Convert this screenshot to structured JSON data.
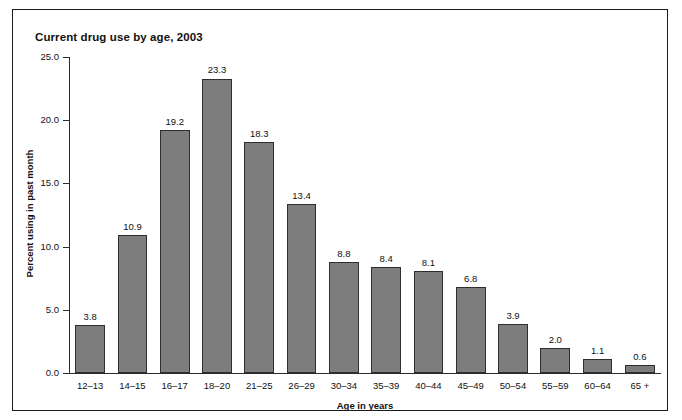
{
  "chart_data": {
    "type": "bar",
    "title": "Current drug use by age, 2003",
    "xlabel": "Age in years",
    "ylabel": "Percent using in past month",
    "categories": [
      "12–13",
      "14–15",
      "16–17",
      "18–20",
      "21–25",
      "26–29",
      "30–34",
      "35–39",
      "40–44",
      "45–49",
      "50–54",
      "55–59",
      "60–64",
      "65 +"
    ],
    "values": [
      3.8,
      10.9,
      19.2,
      23.3,
      18.3,
      13.4,
      8.8,
      8.4,
      8.1,
      6.8,
      3.9,
      2.0,
      1.1,
      0.6
    ],
    "value_labels": [
      "3.8",
      "10.9",
      "19.2",
      "23.3",
      "18.3",
      "13.4",
      "8.8",
      "8.4",
      "8.1",
      "6.8",
      "3.9",
      "2.0",
      "1.1",
      "0.6"
    ],
    "ylim": [
      0.0,
      25.0
    ],
    "ytick_values": [
      0.0,
      5.0,
      10.0,
      15.0,
      20.0,
      25.0
    ],
    "ytick_labels": [
      "0.0",
      "5.0",
      "10.0",
      "15.0",
      "20.0",
      "25.0"
    ],
    "grid": false,
    "legend": null,
    "bar_color": "#7d7d7d",
    "bar_edge_color": "#2e2e2e",
    "text_color": "#111111",
    "background_color": "#ffffff"
  }
}
